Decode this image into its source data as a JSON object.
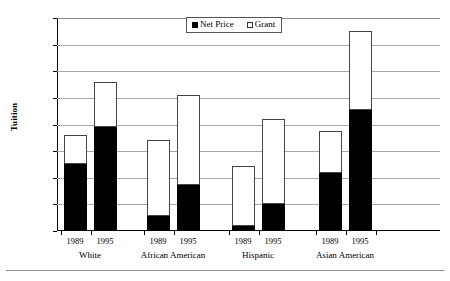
{
  "chart_data": {
    "type": "bar",
    "stacked": true,
    "title": "",
    "xlabel": "",
    "ylabel": "Tuition",
    "ylim": [
      0,
      4000
    ],
    "ytick_labels": [
      "$0",
      "$500",
      "$1,000",
      "$1,500",
      "$2,000",
      "$2,500",
      "$3,000",
      "$3,500",
      "$4,000"
    ],
    "ytick_values": [
      0,
      500,
      1000,
      1500,
      2000,
      2500,
      3000,
      3500,
      4000
    ],
    "grid": true,
    "legend_position": "top-center",
    "legend": [
      "Net Price",
      "Grant"
    ],
    "groups": [
      "White",
      "African American",
      "Hispanic",
      "Asian American"
    ],
    "categories": [
      "1989",
      "1995",
      "1989",
      "1995",
      "1989",
      "1995",
      "1989",
      "1995"
    ],
    "series": [
      {
        "name": "Net Price",
        "color": "#000000",
        "values": [
          1250,
          1950,
          280,
          860,
          100,
          500,
          1090,
          2280
        ]
      },
      {
        "name": "Grant",
        "color": "#ffffff",
        "values": [
          550,
          840,
          1420,
          1690,
          1130,
          1600,
          780,
          1470
        ]
      }
    ],
    "totals": [
      1800,
      2790,
      1700,
      2550,
      1230,
      2100,
      1870,
      3750
    ],
    "bars": [
      {
        "group": "White",
        "year": "1989",
        "net_price": 1250,
        "grant": 550,
        "total": 1800
      },
      {
        "group": "White",
        "year": "1995",
        "net_price": 1950,
        "grant": 840,
        "total": 2790
      },
      {
        "group": "African American",
        "year": "1989",
        "net_price": 280,
        "grant": 1420,
        "total": 1700
      },
      {
        "group": "African American",
        "year": "1995",
        "net_price": 860,
        "grant": 1690,
        "total": 2550
      },
      {
        "group": "Hispanic",
        "year": "1989",
        "net_price": 100,
        "grant": 1130,
        "total": 1230
      },
      {
        "group": "Hispanic",
        "year": "1995",
        "net_price": 500,
        "grant": 1600,
        "total": 2100
      },
      {
        "group": "Asian American",
        "year": "1989",
        "net_price": 1090,
        "grant": 780,
        "total": 1870
      },
      {
        "group": "Asian American",
        "year": "1995",
        "net_price": 2280,
        "grant": 1470,
        "total": 3750
      }
    ]
  }
}
